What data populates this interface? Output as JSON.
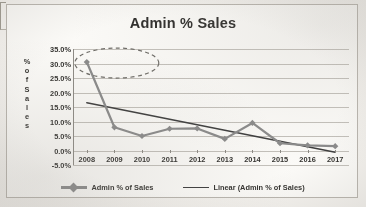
{
  "chart": {
    "title": "Admin % Sales",
    "y_axis_title_letters": [
      "%",
      "o",
      "f",
      "S",
      "a",
      "l",
      "e",
      "s"
    ]
  },
  "chart_data": {
    "type": "line",
    "title": "Admin % Sales",
    "xlabel": "",
    "ylabel": "% of Sales",
    "categories": [
      "2008",
      "2009",
      "2010",
      "2011",
      "2012",
      "2013",
      "2014",
      "2015",
      "2016",
      "2017"
    ],
    "ylim": [
      -5.0,
      35.0
    ],
    "ytick_labels": [
      "35.0%",
      "30.0%",
      "25.0%",
      "20.0%",
      "15.0%",
      "10.0%",
      "5.0%",
      "0.0%",
      "-5.0%"
    ],
    "ytick_values": [
      35.0,
      30.0,
      25.0,
      20.0,
      15.0,
      10.0,
      5.0,
      0.0,
      -5.0
    ],
    "grid": true,
    "legend_position": "bottom",
    "series": [
      {
        "name": "Admin % of Sales",
        "type": "line",
        "marker": "diamond",
        "color": "#8a8a8a",
        "values": [
          30.5,
          8.0,
          5.0,
          7.5,
          7.6,
          4.0,
          9.5,
          2.5,
          1.8,
          1.5
        ]
      },
      {
        "name": "Linear (Admin % of Sales)",
        "type": "trendline",
        "color": "#3c3c3c",
        "values": [
          16.5,
          14.6,
          12.7,
          10.8,
          8.9,
          7.0,
          5.1,
          3.2,
          1.3,
          -0.6
        ]
      }
    ],
    "annotations": [
      {
        "type": "ellipse",
        "style": "dashed",
        "label": "highlight-2008-point",
        "color": "#6e6c67"
      }
    ]
  },
  "legend": {
    "items": [
      {
        "label": "Admin % of Sales",
        "swatch": "series-marker-swatch"
      },
      {
        "label": "Linear (Admin % of Sales)",
        "swatch": "trendline-swatch"
      }
    ]
  }
}
